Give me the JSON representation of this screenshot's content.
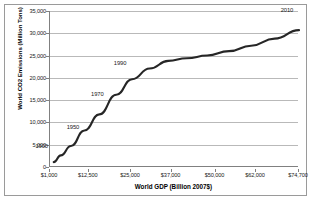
{
  "figure": {
    "border_color": "#9a9a9a",
    "background": "#ffffff"
  },
  "chart_data": {
    "type": "line",
    "title": "",
    "subtitle": "",
    "xlabel": "World GDP (Billion 2007$)",
    "ylabel": "World CO2 Emissions (Million  Tons)",
    "grid": true,
    "legend": "none",
    "line_color": "#262626",
    "xlim": [
      1000,
      74700
    ],
    "ylim": [
      0,
      35000
    ],
    "xticks": [
      1000,
      12500,
      25000,
      37000,
      50000,
      62000,
      74700
    ],
    "xtick_labels": [
      "$1,000",
      "$12,500",
      "$25,000",
      "$37,000",
      "$50,000",
      "$62,000",
      "$74,700"
    ],
    "yticks": [
      0,
      5000,
      10000,
      15000,
      20000,
      25000,
      30000,
      35000
    ],
    "ytick_labels": [
      "0",
      "5,000",
      "10,000",
      "15,000",
      "20,000",
      "25,000",
      "30,000",
      "35,000"
    ],
    "x": [
      2100,
      4200,
      7200,
      11200,
      15600,
      20600,
      25300,
      30500,
      36000,
      41500,
      47500,
      54000,
      60500,
      67500,
      74700
    ],
    "y": [
      1100,
      2600,
      4700,
      8200,
      11800,
      16200,
      19700,
      22100,
      23800,
      24400,
      25000,
      26000,
      27200,
      28800,
      30700
    ],
    "annotations": [
      {
        "label": "1900",
        "x": 2100,
        "y": 1100,
        "dx": -12,
        "dy": -16
      },
      {
        "label": "1950",
        "x": 7200,
        "y": 4700,
        "dx": 2,
        "dy": -19
      },
      {
        "label": "1970",
        "x": 15600,
        "y": 11800,
        "dx": -2,
        "dy": -20
      },
      {
        "label": "1990",
        "x": 25300,
        "y": 19700,
        "dx": -12,
        "dy": -16
      },
      {
        "label": "2010",
        "x": 74700,
        "y": 30700,
        "dx": -12,
        "dy": -20
      }
    ]
  }
}
